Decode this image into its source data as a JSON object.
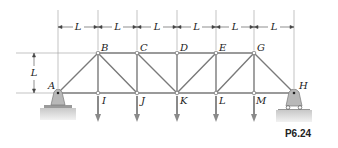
{
  "figure": {
    "caption": "P6.24",
    "dimension_label": "L",
    "span_count": 6,
    "height_label": "L"
  },
  "joints": {
    "top": [
      {
        "name": "B",
        "x": 98
      },
      {
        "name": "C",
        "x": 137
      },
      {
        "name": "D",
        "x": 177
      },
      {
        "name": "E",
        "x": 216
      },
      {
        "name": "G",
        "x": 254
      }
    ],
    "bottom": [
      {
        "name": "I",
        "x": 98
      },
      {
        "name": "J",
        "x": 137
      },
      {
        "name": "K",
        "x": 177
      },
      {
        "name": "L",
        "x": 216
      },
      {
        "name": "M",
        "x": 254
      }
    ],
    "supports": [
      {
        "name": "A",
        "x": 58,
        "type": "pin"
      },
      {
        "name": "H",
        "x": 294,
        "type": "roller"
      }
    ]
  },
  "labels": {
    "A": "A",
    "B": "B",
    "C": "C",
    "D": "D",
    "E": "E",
    "G": "G",
    "H": "H",
    "I": "I",
    "J": "J",
    "K": "K",
    "L": "L",
    "M": "M"
  },
  "dimensions": {
    "span_labels": [
      "L",
      "L",
      "L",
      "L",
      "L",
      "L"
    ],
    "vertical": "L"
  },
  "colors": {
    "member": "#7a7a7a",
    "support": "#b5b5b5",
    "ground": "#d9d9d9",
    "load_arrow": "#8a8a8a",
    "text": "#222222"
  }
}
